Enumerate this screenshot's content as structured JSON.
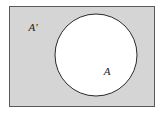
{
  "figure": {
    "kind": "venn-diagram",
    "width": 163,
    "height": 116,
    "background_color": "#ffffff"
  },
  "universe": {
    "name": "universal-set-rectangle",
    "fill_color": "#d5d5d5",
    "stroke_color": "#5a5a5a",
    "stroke_width": 1,
    "x": 9,
    "y": 6,
    "width": 146,
    "height": 101
  },
  "shaded_region": {
    "name": "complement-region",
    "label": "A'",
    "label_x": 33,
    "label_y": 31,
    "fill_color": "#d5d5d5",
    "shaded": true
  },
  "circle": {
    "name": "set-a-circle",
    "label": "A",
    "label_x": 107,
    "label_y": 75,
    "fill_color": "#ffffff",
    "stroke_color": "#2b2b2b",
    "stroke_width": 1,
    "cx": 96,
    "cy": 55,
    "r": 41,
    "shaded": false
  },
  "labels": {
    "complement": "A'",
    "set": "A"
  }
}
